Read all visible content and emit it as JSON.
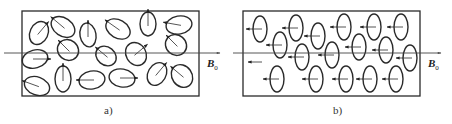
{
  "figure": {
    "panels": [
      {
        "id": "a",
        "caption": "a)",
        "field_label": "B",
        "field_subscript": "0",
        "description": "Randomly oriented magnetic moments (ellipses with arrows pointing in random directions)",
        "box": {
          "x": 22,
          "y": 11,
          "w": 177,
          "h": 85
        },
        "axis_y": 53,
        "axis_x1": 4,
        "axis_x2": 220,
        "ellipses": [
          {
            "cx": 39,
            "cy": 33,
            "rx": 9,
            "ry": 12,
            "rot": 25,
            "arrow": 40
          },
          {
            "cx": 63,
            "cy": 27,
            "rx": 13,
            "ry": 9,
            "rot": 35,
            "arrow": -50
          },
          {
            "cx": 88,
            "cy": 35,
            "rx": 8,
            "ry": 12,
            "rot": -10,
            "arrow": 0
          },
          {
            "cx": 118,
            "cy": 29,
            "rx": 13,
            "ry": 9,
            "rot": 30,
            "arrow": -55
          },
          {
            "cx": 148,
            "cy": 24,
            "rx": 8,
            "ry": 12,
            "rot": 0,
            "arrow": 0
          },
          {
            "cx": 179,
            "cy": 25,
            "rx": 13,
            "ry": 9,
            "rot": -10,
            "arrow": -80
          },
          {
            "cx": 68,
            "cy": 50,
            "rx": 11,
            "ry": 10,
            "rot": 40,
            "arrow": -45
          },
          {
            "cx": 35,
            "cy": 59,
            "rx": 13,
            "ry": 9,
            "rot": -15,
            "arrow": 90
          },
          {
            "cx": 106,
            "cy": 56,
            "rx": 11,
            "ry": 9,
            "rot": 40,
            "arrow": -50
          },
          {
            "cx": 136,
            "cy": 54,
            "rx": 10,
            "ry": 12,
            "rot": -30,
            "arrow": 50
          },
          {
            "cx": 176,
            "cy": 45,
            "rx": 11,
            "ry": 10,
            "rot": 40,
            "arrow": -45
          },
          {
            "cx": 37,
            "cy": 86,
            "rx": 13,
            "ry": 9,
            "rot": 20,
            "arrow": -70
          },
          {
            "cx": 63,
            "cy": 79,
            "rx": 8,
            "ry": 13,
            "rot": 0,
            "arrow": 0
          },
          {
            "cx": 92,
            "cy": 80,
            "rx": 13,
            "ry": 9,
            "rot": -10,
            "arrow": -90
          },
          {
            "cx": 122,
            "cy": 78,
            "rx": 13,
            "ry": 9,
            "rot": 10,
            "arrow": 90
          },
          {
            "cx": 157,
            "cy": 74,
            "rx": 9,
            "ry": 12,
            "rot": 30,
            "arrow": 40
          },
          {
            "cx": 182,
            "cy": 76,
            "rx": 10,
            "ry": 12,
            "rot": -35,
            "arrow": -50
          }
        ]
      },
      {
        "id": "b",
        "caption": "b)",
        "field_label": "B",
        "field_subscript": "0",
        "description": "Aligned magnetic moments (all arrows pointing left, antiparallel to B0)",
        "box": {
          "x": 243,
          "y": 11,
          "w": 177,
          "h": 85
        },
        "axis_y": 53,
        "axis_x1": 233,
        "axis_x2": 441,
        "ellipses": [
          {
            "cx": 260,
            "cy": 29,
            "rx": 7,
            "ry": 13
          },
          {
            "cx": 296,
            "cy": 28,
            "rx": 7,
            "ry": 13
          },
          {
            "cx": 318,
            "cy": 36,
            "rx": 7,
            "ry": 13
          },
          {
            "cx": 344,
            "cy": 27,
            "rx": 7,
            "ry": 13
          },
          {
            "cx": 374,
            "cy": 27,
            "rx": 7,
            "ry": 13
          },
          {
            "cx": 401,
            "cy": 27,
            "rx": 7,
            "ry": 13
          },
          {
            "cx": 280,
            "cy": 45,
            "rx": 7,
            "ry": 13
          },
          {
            "cx": 302,
            "cy": 57,
            "rx": 7,
            "ry": 13
          },
          {
            "cx": 332,
            "cy": 55,
            "rx": 7,
            "ry": 13
          },
          {
            "cx": 359,
            "cy": 47,
            "rx": 7,
            "ry": 13
          },
          {
            "cx": 386,
            "cy": 50,
            "rx": 7,
            "ry": 13
          },
          {
            "cx": 410,
            "cy": 58,
            "rx": 7,
            "ry": 13
          },
          {
            "cx": 277,
            "cy": 79,
            "rx": 7,
            "ry": 13
          },
          {
            "cx": 316,
            "cy": 79,
            "rx": 7,
            "ry": 13
          },
          {
            "cx": 346,
            "cy": 79,
            "rx": 7,
            "ry": 13
          },
          {
            "cx": 370,
            "cy": 79,
            "rx": 7,
            "ry": 13
          },
          {
            "cx": 396,
            "cy": 79,
            "rx": 7,
            "ry": 13
          }
        ],
        "free_arrow": {
          "x1": 262,
          "x2": 248,
          "y": 62
        }
      }
    ],
    "colors": {
      "stroke": "#2a2a2a",
      "axis": "#444444",
      "background": "#ffffff"
    }
  }
}
